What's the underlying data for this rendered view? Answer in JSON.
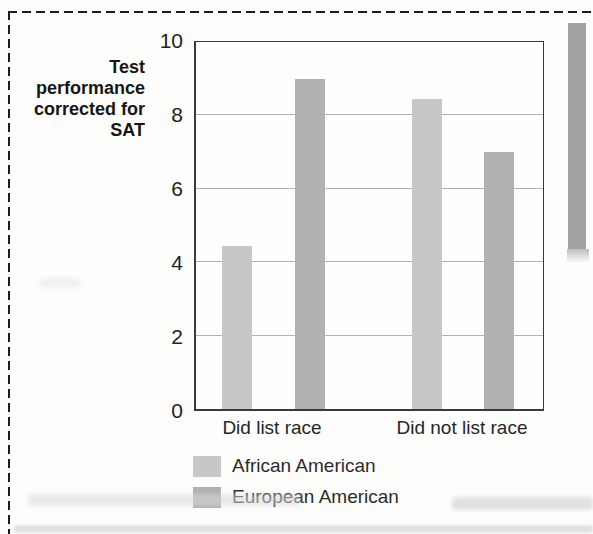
{
  "chart_data": {
    "type": "bar",
    "title": "",
    "xlabel": "",
    "ylabel": "Test performance corrected for SAT",
    "ylabel_lines": [
      "Test",
      "performance",
      "corrected for",
      "SAT"
    ],
    "categories": [
      "Did list race",
      "Did not list race"
    ],
    "series": [
      {
        "name": "African American",
        "color": "#c7c7c7",
        "values": [
          4.45,
          8.45
        ]
      },
      {
        "name": "European American",
        "color": "#b1b1b1",
        "values": [
          9.0,
          7.0
        ]
      }
    ],
    "ylim": [
      0,
      10
    ],
    "yticks": [
      0,
      2,
      4,
      6,
      8,
      10
    ],
    "grid": true,
    "legend_position": "below-plot-left"
  },
  "colors": {
    "african_american_bar": "#c7c7c7",
    "european_american_bar": "#b1b1b1",
    "page_tab_strip": "#a3a3a3",
    "dashed_border": "#1c1c1c",
    "gridline": "#b3b3b3"
  }
}
